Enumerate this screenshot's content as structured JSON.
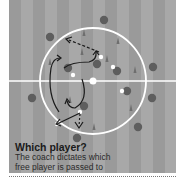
{
  "caption": {
    "title": "Which player?",
    "lines": [
      "The coach dictates which",
      "free player is passed to"
    ]
  },
  "colors": {
    "pitch_light": "#a8a8a8",
    "pitch_dark": "#9a9a9a",
    "lines": "#ffffff",
    "player": "#5e5e5e",
    "ball": "#ffffff",
    "cone": "#6e6e6e",
    "arrow": "#1a1a1a"
  },
  "diagram": {
    "halfway_line_y": 81,
    "center_circle": {
      "cx": 84,
      "cy": 81,
      "r": 53
    },
    "players": [
      {
        "x": 95,
        "y": 20
      },
      {
        "x": 41,
        "y": 37
      },
      {
        "x": 88,
        "y": 64
      },
      {
        "x": 59,
        "y": 68
      },
      {
        "x": 108,
        "y": 71
      },
      {
        "x": 144,
        "y": 67
      },
      {
        "x": 118,
        "y": 91
      },
      {
        "x": 23,
        "y": 98
      },
      {
        "x": 143,
        "y": 98
      },
      {
        "x": 75,
        "y": 106
      },
      {
        "x": 129,
        "y": 127
      },
      {
        "x": 68,
        "y": 138
      }
    ],
    "balls": [
      {
        "x": 92,
        "y": 57
      },
      {
        "x": 104,
        "y": 67
      },
      {
        "x": 64,
        "y": 75
      },
      {
        "x": 113,
        "y": 91
      },
      {
        "x": 71,
        "y": 112
      },
      {
        "x": 48,
        "y": 124
      }
    ],
    "cones": [
      {
        "x": 75,
        "y": 33
      },
      {
        "x": 109,
        "y": 41
      },
      {
        "x": 73,
        "y": 52
      },
      {
        "x": 41,
        "y": 62
      },
      {
        "x": 98,
        "y": 59
      },
      {
        "x": 126,
        "y": 70
      },
      {
        "x": 61,
        "y": 100
      },
      {
        "x": 122,
        "y": 108
      },
      {
        "x": 85,
        "y": 127
      }
    ]
  }
}
